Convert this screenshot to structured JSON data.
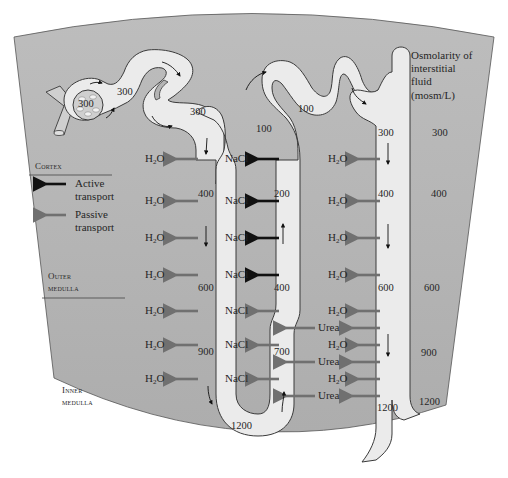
{
  "zones": {
    "cortex": "Cortex",
    "outer_medulla": [
      "Outer",
      "medulla"
    ],
    "inner_medulla": [
      "Inner",
      "medulla"
    ]
  },
  "legend": {
    "active": {
      "label": [
        "Active",
        "transport"
      ],
      "color": "#111111"
    },
    "passive": {
      "label": [
        "Passive",
        "transport"
      ],
      "color": "#707070"
    }
  },
  "interstitial": {
    "title": [
      "Osmolarity of",
      "interstitial",
      "fluid",
      "(mosm/L)"
    ],
    "values": [
      "300",
      "400",
      "600",
      "900",
      "1200"
    ]
  },
  "nephron_values": {
    "glomerulus": "300",
    "proximal_tubule": "300",
    "proximal_exit": "300",
    "descending": [
      "400",
      "600",
      "900"
    ],
    "loop_bottom": "1200",
    "ascending": [
      "700",
      "400",
      "200",
      "100"
    ],
    "distal": "100",
    "collecting_duct": [
      "300",
      "400",
      "600",
      "1200"
    ]
  },
  "molecules": {
    "water": "H",
    "water_sub": "2",
    "water_tail": "O",
    "salt": "NaCl",
    "urea": "Urea"
  },
  "colors": {
    "background_tissue": "#b4b4b4",
    "tubule_fill": "#ebebeb",
    "outline": "#3a3a3a",
    "active_arrow": "#111111",
    "passive_arrow": "#707070"
  }
}
